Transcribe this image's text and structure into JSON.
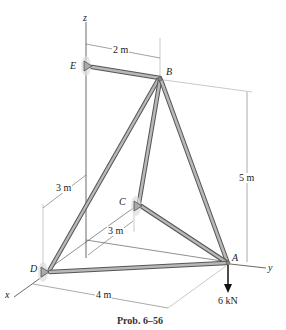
{
  "figure": {
    "caption": "Prob. 6–56",
    "axes": {
      "x": "x",
      "y": "y",
      "z": "z"
    },
    "joints": {
      "A": "A",
      "B": "B",
      "C": "C",
      "D": "D",
      "E": "E"
    },
    "dimensions": {
      "EB": "2 m",
      "height": "5 m",
      "D_offset": "3 m",
      "C_offset": "3 m",
      "DA": "4 m"
    },
    "load": "6 kN",
    "colors": {
      "member": "#9a9a9a",
      "member_edge": "#555555",
      "line": "#333333",
      "support": "#8a8a8a"
    }
  }
}
